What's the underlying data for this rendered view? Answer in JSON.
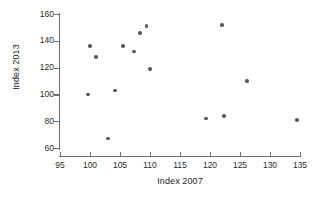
{
  "chart_data": {
    "type": "scatter",
    "title": "",
    "xlabel": "Index 2007",
    "ylabel": "Index 2013",
    "xlim": [
      95,
      135
    ],
    "ylim": [
      60,
      160
    ],
    "xticks": [
      95,
      100,
      105,
      110,
      115,
      120,
      125,
      130,
      135
    ],
    "yticks": [
      60,
      80,
      100,
      120,
      140,
      160
    ],
    "grid": false,
    "legend": null,
    "marker_color": "#5a5a5a",
    "axis_color": "#6e6e6e",
    "points": [
      {
        "x": 99.7,
        "y": 100
      },
      {
        "x": 100.0,
        "y": 136
      },
      {
        "x": 101.0,
        "y": 128
      },
      {
        "x": 103.0,
        "y": 67
      },
      {
        "x": 104.2,
        "y": 103
      },
      {
        "x": 105.5,
        "y": 136
      },
      {
        "x": 107.3,
        "y": 132
      },
      {
        "x": 108.3,
        "y": 146
      },
      {
        "x": 109.4,
        "y": 151
      },
      {
        "x": 110.0,
        "y": 119
      },
      {
        "x": 119.3,
        "y": 82
      },
      {
        "x": 122.0,
        "y": 152
      },
      {
        "x": 122.3,
        "y": 84
      },
      {
        "x": 126.2,
        "y": 110
      },
      {
        "x": 134.5,
        "y": 81
      }
    ]
  },
  "axis": {
    "y_tick_labels": [
      "160",
      "140",
      "120",
      "100",
      "80",
      "60"
    ],
    "x_tick_labels": [
      "95",
      "100",
      "105",
      "110",
      "115",
      "120",
      "125",
      "130",
      "135"
    ],
    "y_title": "Index 2013",
    "x_title": "Index 2007"
  }
}
